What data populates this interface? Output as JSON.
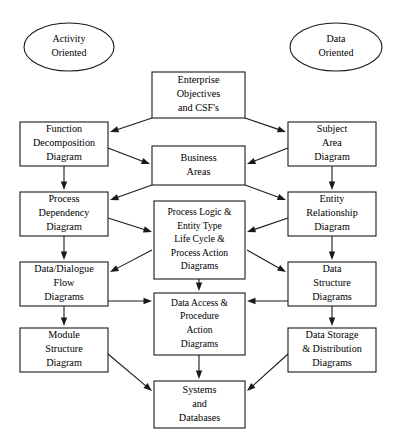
{
  "diagram": {
    "background_color": "#ffffff",
    "line_color": "#1a1a1a",
    "text_color": "#000000",
    "ellipses": [
      {
        "id": "activity-oriented",
        "name": "ellipse-activity-oriented",
        "lines": [
          "Activity",
          "Oriented"
        ],
        "cx": 69,
        "cy": 47,
        "rx": 45,
        "ry": 24
      },
      {
        "id": "data-oriented",
        "name": "ellipse-data-oriented",
        "lines": [
          "Data",
          "Oriented"
        ],
        "cx": 336,
        "cy": 47,
        "rx": 46,
        "ry": 24
      }
    ],
    "boxes": [
      {
        "id": "enterprise-objectives",
        "name": "box-enterprise-objectives",
        "lines": [
          "Enterprise",
          "Objectives",
          "and CSF's"
        ],
        "x": 152,
        "y": 72,
        "w": 93,
        "h": 46
      },
      {
        "id": "function-decomposition",
        "name": "box-function-decomposition",
        "lines": [
          "Function",
          "Decomposition",
          "Diagram"
        ],
        "x": 20,
        "y": 122,
        "w": 88,
        "h": 44
      },
      {
        "id": "subject-area",
        "name": "box-subject-area",
        "lines": [
          "Subject",
          "Area",
          "Diagram"
        ],
        "x": 288,
        "y": 122,
        "w": 88,
        "h": 44
      },
      {
        "id": "business-areas",
        "name": "box-business-areas",
        "lines": [
          "Business",
          "Areas"
        ],
        "x": 152,
        "y": 146,
        "w": 93,
        "h": 39
      },
      {
        "id": "process-dependency",
        "name": "box-process-dependency",
        "lines": [
          "Process",
          "Dependency",
          "Diagram"
        ],
        "x": 20,
        "y": 192,
        "w": 88,
        "h": 44
      },
      {
        "id": "entity-relationship",
        "name": "box-entity-relationship",
        "lines": [
          "Entity",
          "Relationship",
          "Diagram"
        ],
        "x": 288,
        "y": 192,
        "w": 88,
        "h": 44
      },
      {
        "id": "process-logic",
        "name": "box-process-logic",
        "lines": [
          "Process Logic &",
          "Entity Type",
          "Life Cycle &",
          "Process Action",
          "Diagrams"
        ],
        "x": 154,
        "y": 201,
        "w": 91,
        "h": 78
      },
      {
        "id": "data-dialogue-flow",
        "name": "box-data-dialogue-flow",
        "lines": [
          "Data/Dialogue",
          "Flow",
          "Diagrams"
        ],
        "x": 20,
        "y": 262,
        "w": 88,
        "h": 44
      },
      {
        "id": "data-structure",
        "name": "box-data-structure",
        "lines": [
          "Data",
          "Structure",
          "Diagrams"
        ],
        "x": 288,
        "y": 262,
        "w": 88,
        "h": 44
      },
      {
        "id": "data-access-procedure",
        "name": "box-data-access-procedure",
        "lines": [
          "Data Access &",
          "Procedure",
          "Action",
          "Diagrams"
        ],
        "x": 154,
        "y": 293,
        "w": 91,
        "h": 62
      },
      {
        "id": "module-structure",
        "name": "box-module-structure",
        "lines": [
          "Module",
          "Structure",
          "Diagram"
        ],
        "x": 20,
        "y": 328,
        "w": 88,
        "h": 44
      },
      {
        "id": "data-storage-distribution",
        "name": "box-data-storage-distribution",
        "lines": [
          "Data Storage",
          "& Distribution",
          "Diagrams"
        ],
        "x": 288,
        "y": 328,
        "w": 88,
        "h": 44
      },
      {
        "id": "systems-databases",
        "name": "box-systems-databases",
        "lines": [
          "Systems",
          "and",
          "Databases"
        ],
        "x": 154,
        "y": 381,
        "w": 91,
        "h": 47
      }
    ],
    "edges": [
      {
        "id": "e1",
        "from": "enterprise-objectives",
        "to": "function-decomposition",
        "x1": 152,
        "y1": 118,
        "x2": 110,
        "y2": 132
      },
      {
        "id": "e2",
        "from": "enterprise-objectives",
        "to": "subject-area",
        "x1": 245,
        "y1": 118,
        "x2": 286,
        "y2": 132
      },
      {
        "id": "e3",
        "from": "function-decomposition",
        "to": "business-areas",
        "x1": 108,
        "y1": 148,
        "x2": 150,
        "y2": 164
      },
      {
        "id": "e4",
        "from": "subject-area",
        "to": "business-areas",
        "x1": 288,
        "y1": 148,
        "x2": 247,
        "y2": 164
      },
      {
        "id": "e5",
        "from": "function-decomposition",
        "to": "process-dependency",
        "x1": 64,
        "y1": 166,
        "x2": 64,
        "y2": 190
      },
      {
        "id": "e6",
        "from": "subject-area",
        "to": "entity-relationship",
        "x1": 332,
        "y1": 166,
        "x2": 332,
        "y2": 190
      },
      {
        "id": "e7",
        "from": "business-areas",
        "to": "process-dependency",
        "x1": 152,
        "y1": 185,
        "x2": 110,
        "y2": 200
      },
      {
        "id": "e8",
        "from": "business-areas",
        "to": "entity-relationship",
        "x1": 245,
        "y1": 185,
        "x2": 286,
        "y2": 200
      },
      {
        "id": "e9",
        "from": "process-dependency",
        "to": "process-logic",
        "x1": 108,
        "y1": 218,
        "x2": 152,
        "y2": 232
      },
      {
        "id": "e10",
        "from": "entity-relationship",
        "to": "process-logic",
        "x1": 288,
        "y1": 218,
        "x2": 247,
        "y2": 232
      },
      {
        "id": "e11",
        "from": "process-logic",
        "to": "data-dialogue-flow",
        "x1": 152,
        "y1": 250,
        "x2": 110,
        "y2": 272
      },
      {
        "id": "e12",
        "from": "process-logic",
        "to": "data-structure",
        "x1": 247,
        "y1": 250,
        "x2": 286,
        "y2": 272
      },
      {
        "id": "e13",
        "from": "process-dependency",
        "to": "data-dialogue-flow",
        "x1": 64,
        "y1": 236,
        "x2": 64,
        "y2": 260
      },
      {
        "id": "e14",
        "from": "entity-relationship",
        "to": "data-structure",
        "x1": 332,
        "y1": 236,
        "x2": 332,
        "y2": 260
      },
      {
        "id": "e15",
        "from": "process-logic",
        "to": "data-access-procedure",
        "x1": 199,
        "y1": 279,
        "x2": 199,
        "y2": 291
      },
      {
        "id": "e16",
        "from": "data-dialogue-flow",
        "to": "data-access-procedure",
        "x1": 108,
        "y1": 301,
        "x2": 152,
        "y2": 301
      },
      {
        "id": "e17",
        "from": "data-structure",
        "to": "data-access-procedure",
        "x1": 288,
        "y1": 301,
        "x2": 247,
        "y2": 301
      },
      {
        "id": "e18",
        "from": "data-dialogue-flow",
        "to": "module-structure",
        "x1": 64,
        "y1": 306,
        "x2": 64,
        "y2": 326
      },
      {
        "id": "e19",
        "from": "data-structure",
        "to": "data-storage-distribution",
        "x1": 332,
        "y1": 306,
        "x2": 332,
        "y2": 326
      },
      {
        "id": "e20",
        "from": "data-access-procedure",
        "to": "systems-databases",
        "x1": 199,
        "y1": 355,
        "x2": 199,
        "y2": 379
      },
      {
        "id": "e21",
        "from": "module-structure",
        "to": "systems-databases",
        "x1": 108,
        "y1": 354,
        "x2": 152,
        "y2": 391
      },
      {
        "id": "e22",
        "from": "data-storage-distribution",
        "to": "systems-databases",
        "x1": 288,
        "y1": 354,
        "x2": 247,
        "y2": 391
      }
    ]
  }
}
